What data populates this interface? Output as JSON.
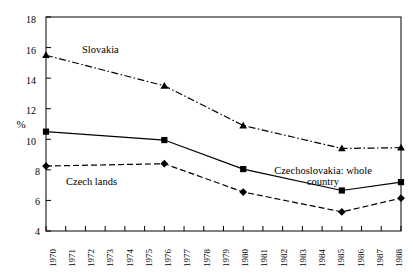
{
  "chart_data": {
    "type": "line",
    "title": "",
    "xlabel": "",
    "ylabel": "%",
    "xlim": [
      1970,
      1988
    ],
    "ylim": [
      4,
      18
    ],
    "ytick_values": [
      4,
      6,
      8,
      10,
      12,
      14,
      16,
      18
    ],
    "ytick_labels": [
      "4",
      "6",
      "8",
      "10",
      "12",
      "14",
      "16",
      "18"
    ],
    "xtick_values": [
      1970,
      1971,
      1972,
      1973,
      1974,
      1975,
      1976,
      1977,
      1978,
      1979,
      1980,
      1981,
      1982,
      1983,
      1984,
      1985,
      1986,
      1987,
      1988
    ],
    "xtick_labels": [
      "1970",
      "1971",
      "1972",
      "1973",
      "1974",
      "1975",
      "1976",
      "1977",
      "1978",
      "1979",
      "1980",
      "1981",
      "1982",
      "1983",
      "1984",
      "1985",
      "1986",
      "1987",
      "1988"
    ],
    "grid": false,
    "legend_position": "inline-annotations",
    "x": [
      1970,
      1976,
      1980,
      1985,
      1988
    ],
    "series": [
      {
        "name": "Slovakia",
        "values": [
          15.5,
          13.5,
          10.9,
          9.4,
          9.45
        ],
        "marker": "triangle",
        "linestyle": "dash-dot",
        "color": "#000000"
      },
      {
        "name": "Czechoslovakia: whole country",
        "values": [
          10.5,
          9.95,
          8.05,
          6.65,
          7.2
        ],
        "marker": "square",
        "linestyle": "solid",
        "color": "#000000"
      },
      {
        "name": "Czech lands",
        "values": [
          8.25,
          8.4,
          6.55,
          5.25,
          6.15
        ],
        "marker": "diamond",
        "linestyle": "dashed",
        "color": "#000000"
      }
    ],
    "annotations": [
      {
        "text": "Slovakia",
        "x": 1974.2,
        "y": 15.3
      },
      {
        "text": "Czech lands",
        "x": 1972.0,
        "y": 7.45
      },
      {
        "text": "Czechoslovakia: whole",
        "x": 1983.4,
        "y": 8.15
      },
      {
        "text": "country",
        "x": 1984.6,
        "y": 7.45
      }
    ]
  },
  "axes": {
    "y_axis_label": "%",
    "frame_color": "#000000"
  }
}
